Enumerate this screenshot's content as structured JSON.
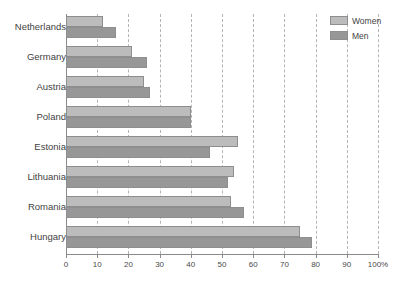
{
  "chart_data": {
    "type": "bar",
    "orientation": "horizontal",
    "title": "",
    "subtitle": "",
    "xlabel": "",
    "ylabel": "",
    "xlim": [
      0,
      100
    ],
    "xtick_values": [
      0,
      10,
      20,
      30,
      40,
      50,
      60,
      70,
      80,
      90,
      100
    ],
    "xtick_labels": [
      "0",
      "10",
      "20",
      "30",
      "40",
      "50",
      "60",
      "70",
      "80",
      "90",
      "100%"
    ],
    "grid": "vertical-dashed",
    "legend_position": "top-right",
    "categories": [
      "Netherlands",
      "Germany",
      "Austria",
      "Poland",
      "Estonia",
      "Lithuania",
      "Romania",
      "Hungary"
    ],
    "series": [
      {
        "name": "Women",
        "color": "#bcbcbc",
        "values": [
          12,
          21,
          25,
          40,
          55,
          54,
          53,
          75
        ]
      },
      {
        "name": "Men",
        "color": "#979797",
        "values": [
          16,
          26,
          27,
          40,
          46,
          52,
          57,
          79
        ]
      }
    ]
  },
  "legend": {
    "items": [
      {
        "label": "Women"
      },
      {
        "label": "Men"
      }
    ]
  },
  "colors": {
    "women": "#bcbcbc",
    "men": "#979797",
    "axis": "#8a8a8a",
    "grid": "#b5b5b5",
    "text": "#3f3f3f",
    "background": "#ffffff"
  }
}
